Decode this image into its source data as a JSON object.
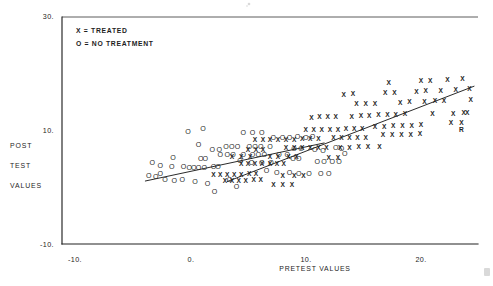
{
  "chart_data": {
    "type": "scatter",
    "title": "",
    "xlabel": "PRETEST VALUES",
    "ylabel": "POST TEST VALUES",
    "xlim": [
      -13,
      26
    ],
    "ylim": [
      -10,
      30
    ],
    "xticks": [
      "-10.",
      "0.",
      "10.",
      "20."
    ],
    "xtick_values": [
      -10,
      0,
      10,
      20
    ],
    "yticks": [
      "30.",
      "10.",
      "-10."
    ],
    "ytick_values": [
      30,
      10,
      -10
    ],
    "grid": false,
    "legend_position": "top-left",
    "legend": [
      {
        "symbol": "X",
        "label": "TREATED",
        "text": "X = TREATED"
      },
      {
        "symbol": "O",
        "label": "NO TREATMENT",
        "text": "O = NO TREATMENT"
      }
    ],
    "series": [
      {
        "name": "NO TREATMENT",
        "symbol": "O",
        "points": [
          [
            -3.6,
            2.0
          ],
          [
            -3.0,
            1.8
          ],
          [
            -2.6,
            2.3
          ],
          [
            -2.2,
            1.2
          ],
          [
            -1.4,
            1.1
          ],
          [
            -3.3,
            4.2
          ],
          [
            -2.6,
            3.7
          ],
          [
            -1.6,
            3.6
          ],
          [
            -0.6,
            3.5
          ],
          [
            -0.1,
            3.4
          ],
          [
            0.3,
            3.4
          ],
          [
            0.7,
            3.4
          ],
          [
            1.2,
            3.4
          ],
          [
            2.0,
            3.5
          ],
          [
            2.4,
            3.5
          ],
          [
            -0.7,
            1.3
          ],
          [
            0.4,
            0.9
          ],
          [
            1.5,
            0.6
          ],
          [
            0.9,
            5.0
          ],
          [
            1.3,
            5.0
          ],
          [
            -1.5,
            5.2
          ],
          [
            2.6,
            5.6
          ],
          [
            3.2,
            5.6
          ],
          [
            3.7,
            5.6
          ],
          [
            4.6,
            5.6
          ],
          [
            5.4,
            5.6
          ],
          [
            5.9,
            5.6
          ],
          [
            6.4,
            5.6
          ],
          [
            3.1,
            7.0
          ],
          [
            3.6,
            7.0
          ],
          [
            4.1,
            7.0
          ],
          [
            5.1,
            7.0
          ],
          [
            5.6,
            7.0
          ],
          [
            6.1,
            7.0
          ],
          [
            6.9,
            7.0
          ],
          [
            0.7,
            7.4
          ],
          [
            4.3,
            4.6
          ],
          [
            5.3,
            4.3
          ],
          [
            6.2,
            4.2
          ],
          [
            7.0,
            4.2
          ],
          [
            7.7,
            5.7
          ],
          [
            8.4,
            5.7
          ],
          [
            8.9,
            5.0
          ],
          [
            9.4,
            5.0
          ],
          [
            7.2,
            8.6
          ],
          [
            8.0,
            8.6
          ],
          [
            8.6,
            8.6
          ],
          [
            9.3,
            8.8
          ],
          [
            10.0,
            8.7
          ],
          [
            10.6,
            8.9
          ],
          [
            6.6,
            2.8
          ],
          [
            7.5,
            2.5
          ],
          [
            8.6,
            2.5
          ],
          [
            9.4,
            2.4
          ],
          [
            10.3,
            2.4
          ],
          [
            11.0,
            4.4
          ],
          [
            11.6,
            4.4
          ],
          [
            12.3,
            4.4
          ],
          [
            12.9,
            4.4
          ],
          [
            11.3,
            2.3
          ],
          [
            12.0,
            2.3
          ],
          [
            4.0,
            0.0
          ],
          [
            2.1,
            -0.8
          ],
          [
            -0.2,
            9.8
          ],
          [
            1.1,
            10.2
          ],
          [
            4.6,
            9.6
          ],
          [
            5.4,
            9.6
          ],
          [
            6.2,
            9.6
          ],
          [
            10.8,
            6.6
          ],
          [
            11.5,
            6.4
          ],
          [
            1.9,
            6.6
          ],
          [
            2.5,
            6.6
          ],
          [
            9.0,
            6.8
          ],
          [
            9.6,
            6.8
          ],
          [
            3.4,
            1.2
          ],
          [
            13.4,
            5.8
          ],
          [
            12.6,
            6.9
          ],
          [
            13.1,
            6.8
          ]
        ]
      },
      {
        "name": "TREATED",
        "symbol": "X",
        "points": [
          [
            2.0,
            2.2
          ],
          [
            2.6,
            2.2
          ],
          [
            3.2,
            2.2
          ],
          [
            3.8,
            2.2
          ],
          [
            4.4,
            2.2
          ],
          [
            5.1,
            2.3
          ],
          [
            5.7,
            2.3
          ],
          [
            3.0,
            1.1
          ],
          [
            3.6,
            1.1
          ],
          [
            4.2,
            1.1
          ],
          [
            4.8,
            1.1
          ],
          [
            5.5,
            1.2
          ],
          [
            6.1,
            1.2
          ],
          [
            4.4,
            4.0
          ],
          [
            5.0,
            4.0
          ],
          [
            5.6,
            4.0
          ],
          [
            6.2,
            4.0
          ],
          [
            6.9,
            4.0
          ],
          [
            7.5,
            4.1
          ],
          [
            8.1,
            4.1
          ],
          [
            3.6,
            5.2
          ],
          [
            4.4,
            5.2
          ],
          [
            5.2,
            5.2
          ],
          [
            6.9,
            5.3
          ],
          [
            7.6,
            5.3
          ],
          [
            5.0,
            6.6
          ],
          [
            5.7,
            6.6
          ],
          [
            6.3,
            6.6
          ],
          [
            8.5,
            5.2
          ],
          [
            9.2,
            5.2
          ],
          [
            5.6,
            8.2
          ],
          [
            6.3,
            8.2
          ],
          [
            6.9,
            8.2
          ],
          [
            7.6,
            8.3
          ],
          [
            8.3,
            8.3
          ],
          [
            9.0,
            8.3
          ],
          [
            9.7,
            8.4
          ],
          [
            10.4,
            8.4
          ],
          [
            11.1,
            8.4
          ],
          [
            8.3,
            6.8
          ],
          [
            9.0,
            6.8
          ],
          [
            9.7,
            6.8
          ],
          [
            10.4,
            6.9
          ],
          [
            11.1,
            6.9
          ],
          [
            11.8,
            6.9
          ],
          [
            10.0,
            10.0
          ],
          [
            10.7,
            10.0
          ],
          [
            11.4,
            10.0
          ],
          [
            12.1,
            10.1
          ],
          [
            12.8,
            10.1
          ],
          [
            13.5,
            10.2
          ],
          [
            14.2,
            10.2
          ],
          [
            14.9,
            10.3
          ],
          [
            12.4,
            8.6
          ],
          [
            13.1,
            8.6
          ],
          [
            13.8,
            8.6
          ],
          [
            14.5,
            8.7
          ],
          [
            15.2,
            8.7
          ],
          [
            13.0,
            6.9
          ],
          [
            13.8,
            6.9
          ],
          [
            14.6,
            7.0
          ],
          [
            15.4,
            7.0
          ],
          [
            16.4,
            7.0
          ],
          [
            10.5,
            12.2
          ],
          [
            11.2,
            12.3
          ],
          [
            11.9,
            12.3
          ],
          [
            12.6,
            12.4
          ],
          [
            14.0,
            12.4
          ],
          [
            14.8,
            12.5
          ],
          [
            15.5,
            12.5
          ],
          [
            16.3,
            12.6
          ],
          [
            17.1,
            12.6
          ],
          [
            17.8,
            12.7
          ],
          [
            18.6,
            12.8
          ],
          [
            16.0,
            10.6
          ],
          [
            16.8,
            10.6
          ],
          [
            17.6,
            10.7
          ],
          [
            18.4,
            10.7
          ],
          [
            19.2,
            10.8
          ],
          [
            20.0,
            10.9
          ],
          [
            16.7,
            9.1
          ],
          [
            17.5,
            9.1
          ],
          [
            18.3,
            9.2
          ],
          [
            19.1,
            9.2
          ],
          [
            19.9,
            9.3
          ],
          [
            14.4,
            14.6
          ],
          [
            15.2,
            14.6
          ],
          [
            16.0,
            14.7
          ],
          [
            18.2,
            14.8
          ],
          [
            19.0,
            14.9
          ],
          [
            20.3,
            15.0
          ],
          [
            21.2,
            15.1
          ],
          [
            22.0,
            15.2
          ],
          [
            13.3,
            16.3
          ],
          [
            14.1,
            16.4
          ],
          [
            16.9,
            16.5
          ],
          [
            17.7,
            16.6
          ],
          [
            19.6,
            16.8
          ],
          [
            20.4,
            16.9
          ],
          [
            21.7,
            17.0
          ],
          [
            23.0,
            17.1
          ],
          [
            17.2,
            18.4
          ],
          [
            20.0,
            18.6
          ],
          [
            20.8,
            18.7
          ],
          [
            22.3,
            18.8
          ],
          [
            23.6,
            19.0
          ],
          [
            8.0,
            2.0
          ],
          [
            9.0,
            2.0
          ],
          [
            9.8,
            2.0
          ],
          [
            7.2,
            0.4
          ],
          [
            8.0,
            0.4
          ],
          [
            8.8,
            0.4
          ],
          [
            22.8,
            12.9
          ],
          [
            23.7,
            13.0
          ],
          [
            22.6,
            11.2
          ],
          [
            23.5,
            11.2
          ],
          [
            12.0,
            5.1
          ],
          [
            12.8,
            5.1
          ],
          [
            21.0,
            12.8
          ],
          [
            24.3,
            15.4
          ],
          [
            24.2,
            17.2
          ],
          [
            24.0,
            13.1
          ]
        ],
        "extra_marker": {
          "symbol": "R",
          "x": 23.5,
          "y": 10.1
        }
      }
    ],
    "fit_lines": [
      {
        "series": "NO TREATMENT",
        "x_start": -3.9,
        "y_start": 1.1,
        "x_end": 11.6,
        "y_end": 7.8
      },
      {
        "series": "TREATED",
        "x_start": 3.2,
        "y_start": 1.0,
        "x_end": 24.6,
        "y_end": 17.8
      }
    ]
  }
}
